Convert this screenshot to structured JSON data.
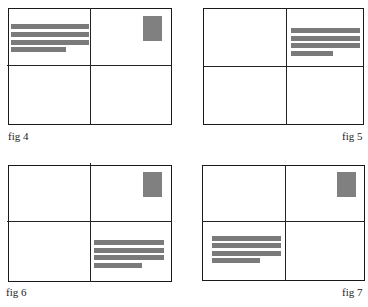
{
  "figures": [
    {
      "caption": "fig 4",
      "address_position": "top-left",
      "stamp_position": "top-right"
    },
    {
      "caption": "fig 5",
      "address_position": "top-right",
      "stamp_position": "none"
    },
    {
      "caption": "fig 6",
      "address_position": "bottom-right",
      "stamp_position": "top-right"
    },
    {
      "caption": "fig 7",
      "address_position": "bottom-left",
      "stamp_position": "top-right"
    }
  ],
  "colors": {
    "border": "#1a1a1a",
    "bar": "#7a7a7a",
    "stamp": "#808080"
  }
}
